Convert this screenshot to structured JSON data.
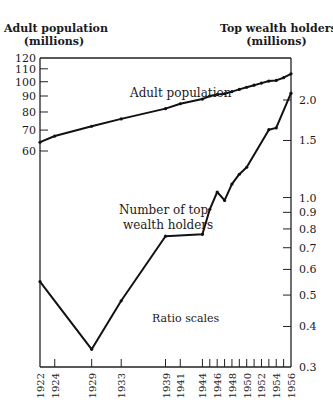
{
  "chart_data": {
    "type": "line",
    "title": "",
    "left_axis": {
      "label_line1": "Adult population",
      "label_line2": "(millions)",
      "scale": "log",
      "range": [
        50,
        120
      ],
      "ticks": [
        60,
        70,
        80,
        90,
        100,
        110,
        120
      ]
    },
    "right_axis": {
      "label_line1": "Top wealth holders",
      "label_line2": "(millions)",
      "scale": "log",
      "range": [
        0.3,
        2.2
      ],
      "ticks": [
        0.3,
        0.4,
        0.5,
        0.6,
        0.7,
        0.8,
        0.9,
        1.0,
        1.5,
        2.0
      ]
    },
    "x_ticks": [
      1922,
      1924,
      1929,
      1933,
      1939,
      1941,
      1944,
      1946,
      1948,
      1950,
      1952,
      1954,
      1956
    ],
    "x_minor_ticks": [
      1945,
      1947,
      1949,
      1951,
      1953,
      1955
    ],
    "xlim": [
      1922,
      1956
    ],
    "annotations": [
      "Adult population",
      "Number of top",
      "wealth holders",
      "Ratio scales"
    ],
    "series": [
      {
        "name": "Adult population",
        "axis": "left",
        "x": [
          1922,
          1924,
          1929,
          1933,
          1939,
          1941,
          1944,
          1945,
          1946,
          1947,
          1948,
          1949,
          1950,
          1951,
          1952,
          1953,
          1954,
          1955,
          1956
        ],
        "values": [
          64,
          67,
          72,
          76,
          82,
          85,
          88,
          90,
          91,
          91.5,
          93,
          94.5,
          96,
          97.5,
          99,
          100.5,
          101,
          103,
          106
        ]
      },
      {
        "name": "Number of top wealth holders",
        "axis": "right",
        "x": [
          1922,
          1929,
          1933,
          1939,
          1944,
          1945,
          1946,
          1947,
          1948,
          1949,
          1950,
          1953,
          1954,
          1956
        ],
        "values": [
          0.55,
          0.34,
          0.48,
          0.76,
          0.77,
          0.92,
          1.04,
          0.98,
          1.1,
          1.18,
          1.24,
          1.62,
          1.64,
          2.1
        ]
      }
    ]
  }
}
